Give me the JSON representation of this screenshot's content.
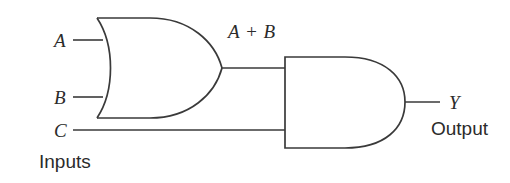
{
  "diagram": {
    "type": "logic-circuit-schematic",
    "stroke_color": "#3a3a3a",
    "background_color": "#ffffff",
    "boolean_expression": "Y = (A + B) · C",
    "inputs": [
      {
        "id": "a",
        "label": "A"
      },
      {
        "id": "b",
        "label": "B"
      },
      {
        "id": "c",
        "label": "C"
      }
    ],
    "input_group_label": "Inputs",
    "intermediate_label": "A + B",
    "output": {
      "label": "Y",
      "caption": "Output"
    },
    "gates": [
      {
        "id": "or1",
        "kind": "OR",
        "inputs": [
          "A",
          "B"
        ],
        "output": "A + B"
      },
      {
        "id": "and1",
        "kind": "AND",
        "inputs": [
          "A + B",
          "C"
        ],
        "output": "Y"
      }
    ]
  }
}
